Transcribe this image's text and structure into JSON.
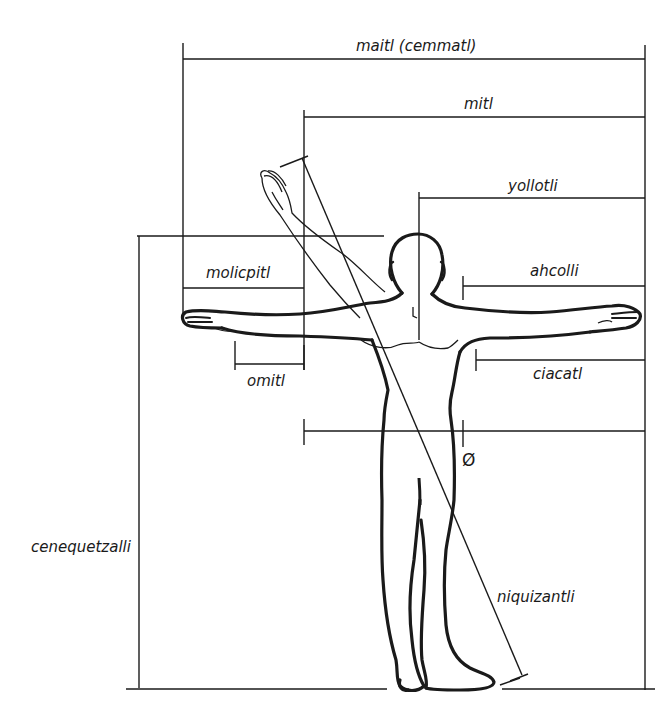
{
  "diagram": {
    "type": "human-body-proportions",
    "colors": {
      "line": "#1a1a1a",
      "background": "#ffffff"
    },
    "labels": {
      "arm_span": "maitl (cemmatl)",
      "arm_length": "mitl",
      "half_span": "yollotli",
      "shoulder_to_fingertip": "ahcolli",
      "forearm_hand": "molicpitl",
      "hand": "omitl",
      "elbow_to_fingertip": "ciacatl",
      "height": "cenequetzalli",
      "diagonal": "niquizantli",
      "diameter_symbol": "Ø"
    }
  }
}
